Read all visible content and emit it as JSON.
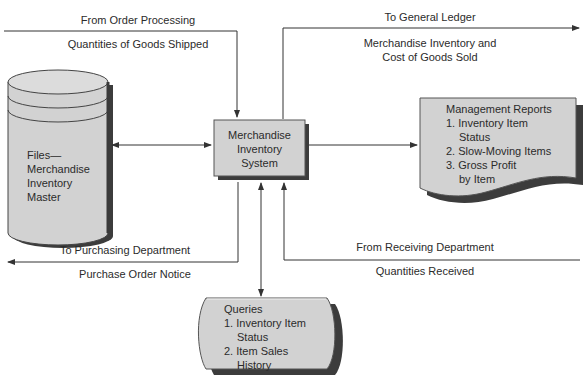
{
  "diagram": {
    "colors": {
      "shape_fill": "#d2d2d2",
      "shape_shadow": "#3c3c3c",
      "line": "#333333",
      "text": "#2b2b2b",
      "background": "#ffffff"
    },
    "nodes": {
      "central": {
        "id": "merchandise-inventory-system",
        "shape": "process-box",
        "lines": [
          "Merchandise",
          "Inventory",
          "System"
        ]
      },
      "files": {
        "id": "files-merchandise-inventory-master",
        "shape": "cylinder",
        "lines": [
          "Files—",
          "Merchandise",
          "Inventory",
          "Master"
        ]
      },
      "reports": {
        "id": "management-reports",
        "shape": "document",
        "title": "Management Reports",
        "items": [
          {
            "num": "1.",
            "lines": [
              "Inventory Item",
              "Status"
            ]
          },
          {
            "num": "2.",
            "lines": [
              "Slow-Moving Items"
            ]
          },
          {
            "num": "3.",
            "lines": [
              "Gross Profit",
              "by Item"
            ]
          }
        ]
      },
      "queries": {
        "id": "queries",
        "shape": "display",
        "title": "Queries",
        "items": [
          {
            "num": "1.",
            "lines": [
              "Inventory Item",
              "Status"
            ]
          },
          {
            "num": "2.",
            "lines": [
              "Item Sales",
              "History"
            ]
          }
        ]
      }
    },
    "flows": {
      "order_processing": {
        "direction": "in",
        "label_top": "From Order Processing",
        "label_bottom": "Quantities of Goods Shipped"
      },
      "general_ledger": {
        "direction": "out",
        "label_top": "To General Ledger",
        "label_bottom_lines": [
          "Merchandise Inventory and",
          "Cost of Goods Sold"
        ]
      },
      "purchasing": {
        "direction": "out",
        "label_top": "To Purchasing Department",
        "label_bottom": "Purchase Order Notice"
      },
      "receiving": {
        "direction": "in",
        "label_top": "From Receiving Department",
        "label_bottom": "Quantities Received"
      },
      "files_link": {
        "direction": "bidirectional"
      },
      "reports_link": {
        "direction": "out"
      },
      "queries_link": {
        "direction": "bidirectional"
      }
    }
  }
}
